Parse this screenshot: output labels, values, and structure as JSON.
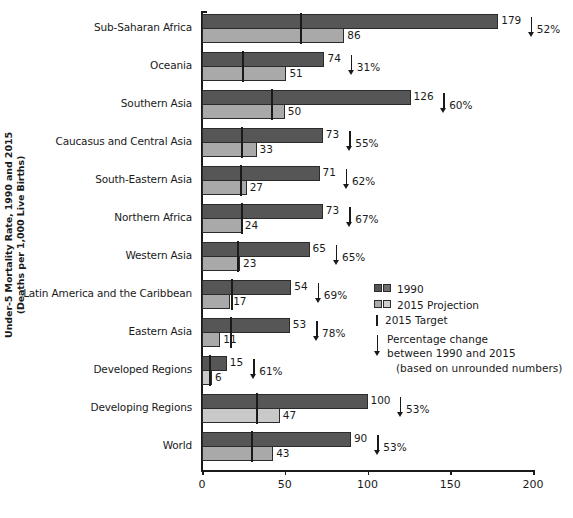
{
  "chart_data": {
    "type": "bar",
    "orientation": "horizontal",
    "title": "",
    "xlabel": "",
    "ylabel": "Under-5 Mortality Rate, 1990 and 2015 (Deaths per 1,000 Live Births)",
    "ylabel_line1": "Under-5 Mortality Rate, 1990 and 2015",
    "ylabel_line2": "(Deaths per 1,000 Live Births)",
    "xlim": [
      0,
      200
    ],
    "xticks": [
      0,
      50,
      100,
      150,
      200
    ],
    "xtick_labels": [
      "0",
      "50",
      "100",
      "150",
      "200"
    ],
    "grid": false,
    "categories": [
      "Sub-Saharan Africa",
      "Oceania",
      "Southern Asia",
      "Caucasus and Central Asia",
      "South-Eastern Asia",
      "Northern Africa",
      "Western Asia",
      "Latin America and the Caribbean",
      "Eastern Asia",
      "Developed Regions",
      "Developing Regions",
      "World"
    ],
    "series": [
      {
        "name": "1990",
        "color": "#565656",
        "values": [
          179,
          74,
          126,
          73,
          71,
          73,
          65,
          54,
          53,
          15,
          100,
          90
        ]
      },
      {
        "name": "2015 Projection",
        "color": "#a9a9a9",
        "values": [
          86,
          51,
          50,
          33,
          27,
          24,
          23,
          17,
          11,
          6,
          47,
          43
        ]
      },
      {
        "name": "2015 Target",
        "color": "#1a1a1a",
        "values": [
          59.7,
          24.7,
          42.0,
          24.3,
          23.7,
          24.3,
          21.7,
          18.0,
          17.7,
          5.0,
          33.3,
          30.0
        ]
      }
    ],
    "percentage_change": [
      "52%",
      "31%",
      "60%",
      "55%",
      "62%",
      "67%",
      "65%",
      "69%",
      "78%",
      "61%",
      "53%",
      "53%"
    ],
    "value_labels_1990": [
      "179",
      "74",
      "126",
      "73",
      "71",
      "73",
      "65",
      "54",
      "53",
      "15",
      "100",
      "90"
    ],
    "value_labels_2015": [
      "86",
      "51",
      "50",
      "33",
      "27",
      "24",
      "23",
      "17",
      "11",
      "6",
      "47",
      "43"
    ]
  },
  "legend": {
    "position": "center-right",
    "entries": [
      {
        "label": "1990"
      },
      {
        "label": "2015 Projection"
      },
      {
        "label": "2015 Target"
      }
    ],
    "note_line1": "Percentage change",
    "note_line2": "between 1990 and 2015",
    "note_line3": "(based on unrounded numbers)"
  }
}
